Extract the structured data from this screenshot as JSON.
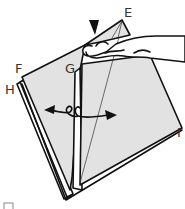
{
  "diagram": {
    "type": "origami-fold-step",
    "labels": {
      "E": "E",
      "F": "F",
      "G": "G",
      "H": "H",
      "I": "I"
    },
    "colors": {
      "paper_fill": "#e2e2e2",
      "outline": "#111111",
      "background": "#ffffff"
    },
    "symbols": {
      "push_arrow": "push-down-arrowhead",
      "open_arrows": "two-way-open-arrows"
    }
  }
}
